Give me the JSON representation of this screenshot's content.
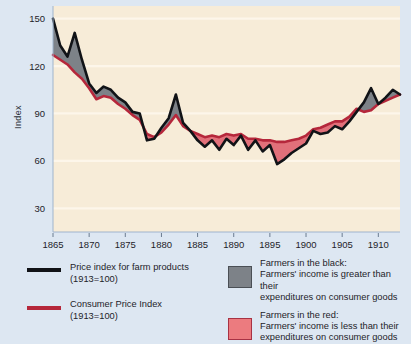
{
  "axes": {
    "ylabel": "Index",
    "yticks": [
      150,
      120,
      90,
      60,
      30
    ],
    "xticks": [
      1865,
      1870,
      1875,
      1880,
      1885,
      1890,
      1895,
      1900,
      1905,
      1910
    ]
  },
  "legend": {
    "left": [
      {
        "marker": "black-line",
        "line1": "Price index for farm products",
        "line2": "(1913=100)"
      },
      {
        "marker": "red-line",
        "line1": "Consumer Price Index",
        "line2": "(1913=100)"
      }
    ],
    "right": [
      {
        "marker": "gray-swatch",
        "title": "Farmers in the black:",
        "line1": "Farmers' income is greater than their",
        "line2": "expenditures on consumer goods"
      },
      {
        "marker": "red-swatch",
        "title": "Farmers in the red:",
        "line1": "Farmers' income is less than their",
        "line2": "expenditures on consumer goods"
      }
    ]
  },
  "colors": {
    "page_background": "#dde7f2",
    "plot_background": "#f7ecd8",
    "farm_price_line": "#111317",
    "consumer_price_line": "#b5273b",
    "black_fill": "#7d8288",
    "red_fill": "#e1707a",
    "gridline": "#fdf6ea"
  },
  "chart_data": {
    "type": "line",
    "title": "",
    "xlabel": "",
    "ylabel": "Index",
    "xlim": [
      1865,
      1913
    ],
    "ylim": [
      15,
      158
    ],
    "grid": true,
    "legend_position": "bottom",
    "x": [
      1865,
      1866,
      1867,
      1868,
      1869,
      1870,
      1871,
      1872,
      1873,
      1874,
      1875,
      1876,
      1877,
      1878,
      1879,
      1880,
      1881,
      1882,
      1883,
      1884,
      1885,
      1886,
      1887,
      1888,
      1889,
      1890,
      1891,
      1892,
      1893,
      1894,
      1895,
      1896,
      1897,
      1898,
      1899,
      1900,
      1901,
      1902,
      1903,
      1904,
      1905,
      1906,
      1907,
      1908,
      1909,
      1910,
      1911,
      1912,
      1913
    ],
    "series": [
      {
        "name": "Price index for farm products (1913=100)",
        "color": "#111317",
        "values": [
          150,
          133,
          126,
          141,
          124,
          109,
          103,
          107,
          105,
          100,
          97,
          91,
          90,
          73,
          74,
          81,
          87,
          102,
          84,
          79,
          73,
          69,
          73,
          67,
          74,
          70,
          76,
          67,
          73,
          66,
          70,
          58,
          61,
          65,
          68,
          71,
          79,
          77,
          78,
          82,
          80,
          85,
          91,
          97,
          106,
          96,
          100,
          105,
          102
        ]
      },
      {
        "name": "Consumer Price Index (1913=100)",
        "color": "#b5273b",
        "values": [
          127,
          124,
          121,
          116,
          112,
          106,
          99,
          101,
          100,
          96,
          93,
          89,
          86,
          77,
          75,
          78,
          83,
          89,
          82,
          79,
          77,
          75,
          76,
          75,
          77,
          76,
          77,
          74,
          74,
          73,
          73,
          72,
          72,
          73,
          74,
          76,
          80,
          81,
          83,
          85,
          85,
          88,
          93,
          91,
          92,
          96,
          98,
          100,
          102
        ]
      }
    ]
  }
}
